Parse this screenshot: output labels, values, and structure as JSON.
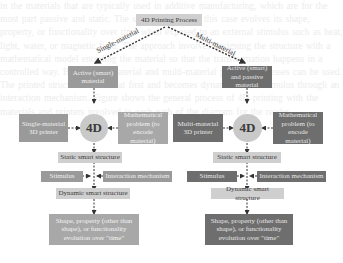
{
  "diagram": {
    "root": "4D Printing Process",
    "branch_labels": {
      "left": "Single-material",
      "right": "Multi-material"
    },
    "left": {
      "active_material": "Active (smart) material",
      "printer": "Single-material 3D printer",
      "math_problem": "Mathematical problem (to encode material)",
      "center": "4D",
      "static": "Static smart structure",
      "stimulus": "Stimulus",
      "interaction": "Interaction mechanism",
      "dynamic": "Dynamic smart structure",
      "outcome": "Shape, property (other than shape), or functionality evolution over \"time\""
    },
    "right": {
      "active_material": "Active (smart) and passive material",
      "printer": "Multi-material 3D printer",
      "math_problem": "Mathematical problem (to encode material)",
      "center": "4D",
      "static": "Static smart structure",
      "stimulus": "Stimulus",
      "interaction": "Interaction mechanism",
      "dynamic": "Dynamic smart structure",
      "outcome": "Shape, property (other than shape), or functionality evolution over \"time\""
    },
    "colors": {
      "light": "#cfcfcf",
      "mid": "#9a9a9a",
      "dark": "#6e6e6e",
      "circle": "#c9c9c9"
    }
  }
}
